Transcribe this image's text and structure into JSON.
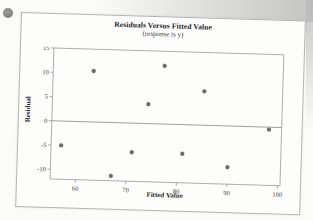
{
  "page": {
    "bullet_color": "#878787"
  },
  "chart_data": {
    "type": "scatter",
    "title": "Residuals Versus Fitted Value",
    "subtitle": "(response is y)",
    "xlabel": "Fitted Value",
    "ylabel": "Residual",
    "xlim": [
      55,
      100.5
    ],
    "ylim": [
      -12,
      15
    ],
    "xticks": [
      60,
      70,
      80,
      90,
      100
    ],
    "yticks": [
      15,
      10,
      5,
      0,
      -5,
      -10
    ],
    "zero_line": true,
    "grid": false,
    "legend": null,
    "points": [
      {
        "x": 57,
        "y": -5
      },
      {
        "x": 63,
        "y": 10.5
      },
      {
        "x": 67,
        "y": -11
      },
      {
        "x": 71,
        "y": -6
      },
      {
        "x": 74,
        "y": 4
      },
      {
        "x": 77,
        "y": 12
      },
      {
        "x": 81,
        "y": -6
      },
      {
        "x": 85,
        "y": 7
      },
      {
        "x": 90,
        "y": -8.5
      },
      {
        "x": 98,
        "y": -0.5
      }
    ],
    "point_color": "#6c6c6c",
    "frame_color": "#9a9a9a",
    "zero_line_color": "#8a8a8a",
    "tick_label_color": "#3a3a3a"
  }
}
